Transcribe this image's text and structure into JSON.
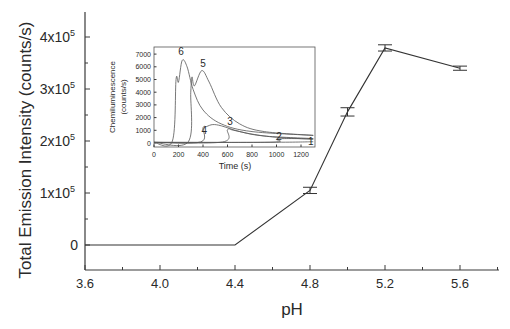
{
  "chart_data": [
    {
      "type": "line",
      "title": "",
      "xlabel": "pH",
      "ylabel": "Total Emission Intensity (counts/s)",
      "x_ticks": [
        "3.6",
        "4.0",
        "4.4",
        "4.8",
        "5.2",
        "5.6"
      ],
      "y_ticks": [
        "0",
        "1x10^5",
        "2x10^5",
        "3x10^5",
        "4x10^5"
      ],
      "xlim": [
        3.6,
        5.8
      ],
      "ylim": [
        -50000,
        450000
      ],
      "grid": false,
      "legend": null,
      "error_bars": true,
      "series": [
        {
          "name": "Total emission",
          "x": [
            3.6,
            4.4,
            4.8,
            5.0,
            5.2,
            5.6
          ],
          "y": [
            0,
            0,
            105000,
            256000,
            379000,
            340000
          ],
          "yerr": [
            0,
            0,
            6000,
            8000,
            6000,
            4000
          ]
        }
      ]
    },
    {
      "type": "line",
      "title": "",
      "inset": true,
      "xlabel": "Time (s)",
      "ylabel": "Chemiluminescence (counts/s)",
      "x_ticks": [
        "0",
        "200",
        "400",
        "600",
        "800",
        "1000",
        "1200"
      ],
      "y_ticks": [
        "0",
        "1000",
        "2000",
        "3000",
        "4000",
        "5000",
        "6000",
        "7000"
      ],
      "xlim": [
        0,
        1300
      ],
      "ylim": [
        -300,
        7600
      ],
      "grid": false,
      "series": [
        {
          "name": "1",
          "x": [
            0,
            1000,
            1300
          ],
          "y": [
            50,
            60,
            100
          ]
        },
        {
          "name": "2",
          "x": [
            0,
            950,
            1000,
            1100,
            1300
          ],
          "y": [
            50,
            60,
            300,
            350,
            320
          ]
        },
        {
          "name": "3",
          "x": [
            0,
            560,
            600,
            650,
            800,
            1000,
            1300
          ],
          "y": [
            50,
            80,
            1050,
            1000,
            700,
            450,
            300
          ]
        },
        {
          "name": "4",
          "x": [
            0,
            380,
            400,
            430,
            480,
            550,
            700,
            900,
            1300
          ],
          "y": [
            50,
            80,
            1200,
            1300,
            1450,
            1350,
            900,
            550,
            350
          ]
        },
        {
          "name": "5",
          "x": [
            0,
            280,
            300,
            310,
            330,
            390,
            450,
            550,
            700,
            900,
            1300
          ],
          "y": [
            50,
            100,
            4000,
            5200,
            4500,
            5700,
            4800,
            2800,
            1500,
            900,
            600
          ]
        },
        {
          "name": "6",
          "x": [
            0,
            150,
            180,
            200,
            230,
            270,
            320,
            400,
            550,
            800,
            1300
          ],
          "y": [
            50,
            150,
            5000,
            4800,
            6500,
            6000,
            4200,
            2600,
            1500,
            900,
            600
          ]
        }
      ],
      "curve_labels": [
        {
          "text": "6",
          "x": 220,
          "y": 6900
        },
        {
          "text": "5",
          "x": 400,
          "y": 6000
        },
        {
          "text": "4",
          "x": 410,
          "y": 700
        },
        {
          "text": "3",
          "x": 620,
          "y": 1400
        },
        {
          "text": "2",
          "x": 1020,
          "y": 200
        },
        {
          "text": "1",
          "x": 1280,
          "y": -150
        }
      ]
    }
  ],
  "main": {
    "ylabel": "Total Emission Intensity (counts/s)",
    "xlabel": "pH"
  },
  "inset": {
    "ylabel_line1": "Chemiluminescence",
    "ylabel_line2": "(counts/s)",
    "xlabel": "Time (s)"
  }
}
